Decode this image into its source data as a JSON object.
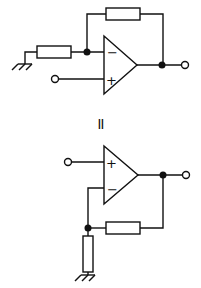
{
  "diagram": {
    "type": "op-amp equivalence schematic",
    "equivalence_symbol": "=",
    "top_circuit": {
      "name": "Inverting-configuration redrawn (input on + , grounded resistor to −)",
      "opamp": {
        "inverting_label": "−",
        "noninverting_label": "+"
      },
      "components": [
        "feedback resistor",
        "input resistor to ground",
        "input terminal",
        "output terminal"
      ]
    },
    "bottom_circuit": {
      "name": "Non-inverting amplifier",
      "opamp": {
        "inverting_label": "−",
        "noninverting_label": "+"
      },
      "components": [
        "feedback resistor",
        "resistor to ground",
        "input terminal",
        "output terminal"
      ]
    },
    "colors": {
      "line": "#111111",
      "background": "#ffffff"
    }
  }
}
